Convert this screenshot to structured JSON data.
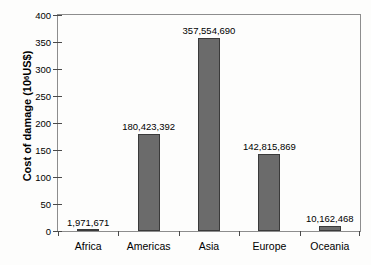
{
  "chart_data": {
    "type": "bar",
    "title": "",
    "xlabel": "",
    "ylabel": "Cost of damage (10⁶ US$)",
    "ylabel_prefix": "Cost of damage (10",
    "ylabel_exponent": "6",
    "ylabel_suffix": " US$)",
    "categories": [
      "Africa",
      "Americas",
      "Asia",
      "Europe",
      "Oceania"
    ],
    "values": [
      1.971671,
      180.423392,
      357.55469,
      142.815869,
      10.162468
    ],
    "value_labels": [
      "1,971,671",
      "180,423,392",
      "357,554,690",
      "142,815,869",
      "10,162,468"
    ],
    "ylim": [
      0,
      400
    ],
    "yticks": [
      0,
      50,
      100,
      150,
      200,
      250,
      300,
      350,
      400
    ],
    "ytick_labels": [
      "0",
      "50",
      "100",
      "150",
      "200",
      "250",
      "300",
      "350",
      "400"
    ],
    "grid": false,
    "legend": null,
    "bar_color": "#6b6b6b",
    "bar_edge_color": "#3a3a3a",
    "axis_color": "#4a4a4a",
    "background": "#fdfdfc"
  }
}
